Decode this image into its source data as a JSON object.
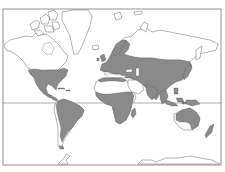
{
  "map": {
    "type": "world distribution map",
    "projection": "Mercator-like",
    "background_color": "#ffffff",
    "range_fill_color": "#8a8a8a",
    "outline_color": "#6a6a6a",
    "frame": {
      "left": 3,
      "top": 9,
      "right": 221,
      "bottom": 165
    },
    "equator_y": 103,
    "shaded_regions": [
      "eastern and central North America",
      "Mexico and Central America",
      "South America (east and north)",
      "Europe",
      "temperate Asia",
      "South and Southeast Asia",
      "sub-Saharan Africa",
      "North African coast",
      "Madagascar",
      "Japan",
      "Indonesia and Philippines",
      "New Guinea",
      "coastal Australia",
      "New Zealand"
    ],
    "unshaded_land": [
      "Canada and Arctic islands",
      "Greenland",
      "Siberia",
      "Sahara",
      "Arabian Peninsula",
      "central/western Australia",
      "western South America coast",
      "Antarctica"
    ],
    "text_labels": []
  }
}
